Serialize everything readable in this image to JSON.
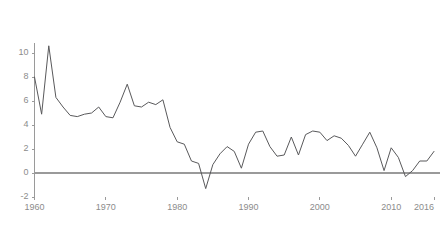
{
  "chart_data": {
    "type": "line",
    "title": "",
    "subtitle": "",
    "xlabel": "",
    "ylabel": "",
    "xlim": [
      1960,
      2016
    ],
    "ylim": [
      -2,
      10.8
    ],
    "grid": false,
    "legend": false,
    "legend_position": "none",
    "zero_line": true,
    "series": [
      {
        "name": "annual rate",
        "color": "#59595b",
        "x": [
          1960,
          1961,
          1962,
          1963,
          1964,
          1965,
          1966,
          1967,
          1968,
          1969,
          1970,
          1971,
          1972,
          1973,
          1974,
          1975,
          1976,
          1977,
          1978,
          1979,
          1980,
          1981,
          1982,
          1983,
          1984,
          1985,
          1986,
          1987,
          1988,
          1989,
          1990,
          1991,
          1992,
          1993,
          1994,
          1995,
          1996,
          1997,
          1998,
          1999,
          2000,
          2001,
          2002,
          2003,
          2004,
          2005,
          2006,
          2007,
          2008,
          2009,
          2010,
          2011,
          2012,
          2013,
          2014,
          2015,
          2016
        ],
        "values": [
          8.0,
          4.9,
          10.6,
          6.3,
          5.5,
          4.8,
          4.7,
          4.9,
          5.0,
          5.5,
          4.7,
          4.6,
          5.9,
          7.4,
          5.6,
          5.5,
          5.9,
          5.7,
          6.1,
          3.8,
          2.6,
          2.4,
          1.0,
          0.8,
          -1.3,
          0.7,
          1.6,
          2.2,
          1.8,
          0.4,
          2.4,
          3.4,
          3.5,
          2.2,
          1.4,
          1.5,
          3.0,
          1.5,
          3.2,
          3.5,
          3.4,
          2.7,
          3.1,
          2.9,
          2.3,
          1.4,
          2.4,
          3.4,
          2.1,
          0.2,
          2.1,
          1.3,
          -0.3,
          0.2,
          1.0,
          1.0,
          1.8
        ]
      }
    ],
    "y_ticks": [
      -2,
      0,
      2,
      4,
      6,
      8,
      10
    ],
    "y_tick_labels": [
      "-2",
      "0",
      "2",
      "4",
      "6",
      "8",
      "10"
    ],
    "x_ticks": [
      1960,
      1970,
      1980,
      1990,
      2000,
      2010,
      2016
    ],
    "x_tick_labels": [
      "1960",
      "1970",
      "1980",
      "1990",
      "2000",
      "2010",
      "2016"
    ],
    "axis_color": "#9a9a9a",
    "zero_line_color": "#9a9a9a",
    "tick_label_color": "#8c8c8c"
  }
}
